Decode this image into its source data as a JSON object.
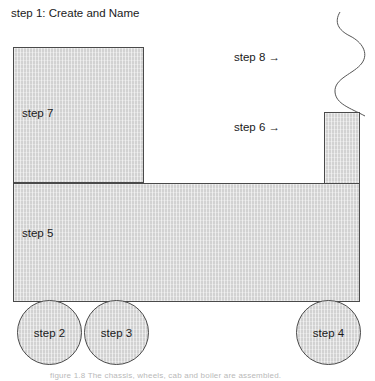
{
  "figure": {
    "title": "step 1:  Create and Name",
    "bottom_caption": "figure 1.8 The chassis, wheels, cab and boiler are assembled."
  },
  "shapes": {
    "cab": {
      "label": "step 7"
    },
    "chassis": {
      "label": "step 5"
    },
    "chimney": {
      "label": ""
    },
    "wheel_left": {
      "label": "step 2"
    },
    "wheel_middle": {
      "label": "step 3"
    },
    "wheel_right": {
      "label": "step 4"
    }
  },
  "callouts": {
    "smoke": "step 8 →",
    "chimney": "step 6 →"
  },
  "colors": {
    "shape_fill": "#d2d2d2",
    "shape_outline": "#4a4a4a",
    "text": "#1a1a1a",
    "background": "#ffffff",
    "smoke_stroke": "#555555"
  }
}
